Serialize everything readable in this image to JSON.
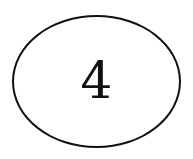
{
  "diagram": {
    "node": {
      "shape": "ellipse",
      "label": "4",
      "stroke_color": "#111111",
      "fill_color": "#ffffff"
    }
  }
}
